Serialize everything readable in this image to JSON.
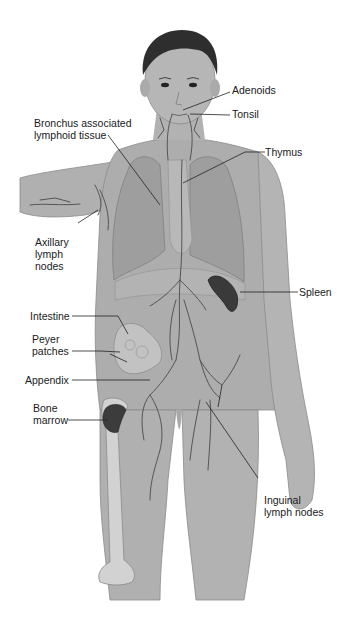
{
  "diagram": {
    "colors": {
      "background": "#ffffff",
      "skin": "#a9a9a9",
      "skin_light": "#c4c4c4",
      "hair": "#2e2e2e",
      "lungs": "#9a9a9a",
      "vessels": "#555555",
      "spleen": "#3a3a3a",
      "bone_marrow": "#3c3c3c",
      "bone": "#d2d2d2",
      "text": "#1a1a1a",
      "leader_line": "#222222"
    },
    "labels": {
      "adenoids": "Adenoids",
      "tonsil": "Tonsil",
      "balt_line1": "Bronchus associated",
      "balt_line2": "lymphoid tissue",
      "thymus": "Thymus",
      "axillary_line1": "Axillary",
      "axillary_line2": "lymph",
      "axillary_line3": "nodes",
      "spleen": "Spleen",
      "intestine": "Intestine",
      "peyer_line1": "Peyer",
      "peyer_line2": "patches",
      "appendix": "Appendix",
      "bone_line1": "Bone",
      "bone_line2": "marrow",
      "inguinal_line1": "Inguinal",
      "inguinal_line2": "lymph nodes"
    }
  }
}
